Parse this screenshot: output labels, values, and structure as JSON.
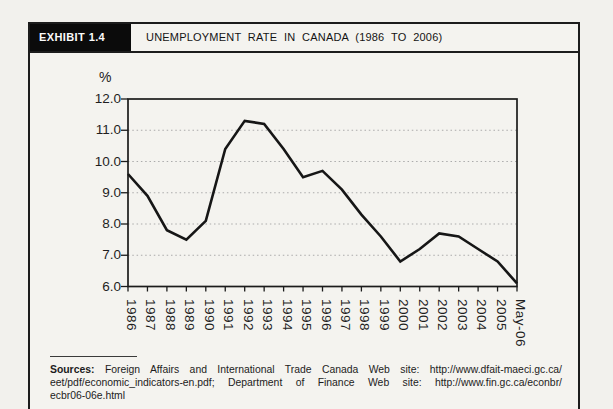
{
  "header": {
    "exhibit_label": "EXHIBIT 1.4",
    "title": "UNEMPLOYMENT RATE IN CANADA (1986 TO 2006)"
  },
  "chart_data": {
    "type": "line",
    "title": "UNEMPLOYMENT RATE IN CANADA (1986 TO 2006)",
    "ylabel": "%",
    "xlabel": "",
    "ylim": [
      6.0,
      12.0
    ],
    "ytick_step": 1.0,
    "ytick_labels": [
      "6.0",
      "7.0",
      "8.0",
      "9.0",
      "10.0",
      "11.0",
      "12.0"
    ],
    "categories": [
      "1986",
      "1987",
      "1988",
      "1989",
      "1990",
      "1991",
      "1992",
      "1993",
      "1994",
      "1995",
      "1996",
      "1997",
      "1998",
      "1999",
      "2000",
      "2001",
      "2002",
      "2003",
      "2004",
      "2005",
      "May-06"
    ],
    "values": [
      9.6,
      8.9,
      7.8,
      7.5,
      8.1,
      10.4,
      11.3,
      11.2,
      10.4,
      9.5,
      9.7,
      9.1,
      8.3,
      7.6,
      6.8,
      7.2,
      7.7,
      7.6,
      7.2,
      6.8,
      6.1
    ],
    "grid": "horizontal dotted gridlines at 7.0-11.0",
    "legend": "none",
    "line_color": "#161616",
    "gridline_color": "#ababab"
  },
  "sources": {
    "label": "Sources:",
    "line1_rest": "Foreign Affairs and International Trade Canada Web site: http://www.dfait-maeci.gc.ca/",
    "line2": "eet/pdf/economic_indicators-en.pdf; Department of Finance Web site: http://www.fin.gc.ca/econbr/",
    "line3": "ecbr06-06e.html"
  }
}
